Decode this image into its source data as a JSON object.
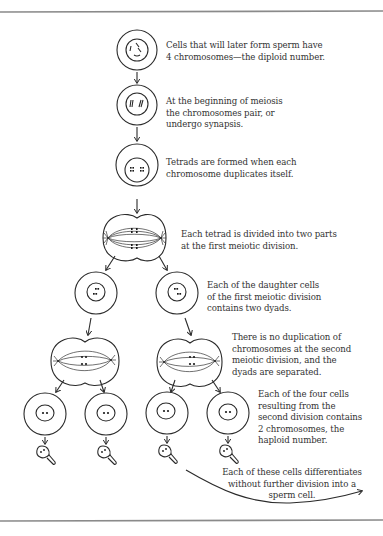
{
  "figure": {
    "colors": {
      "line": "#2a2a2a",
      "text": "#333333",
      "rule": "#8a8a8a",
      "background": "#ffffff"
    },
    "captions": {
      "step1": "Cells that will later form sperm have\n4 chromosomes—the diploid number.",
      "step2": "At the beginning of meiosis\nthe chromosomes pair, or\nundergo synapsis.",
      "step3": "Tetrads are formed when each\nchromosome duplicates itself.",
      "step4": "Each tetrad is divided into two parts\nat the first meiotic division.",
      "step5": "Each of the daughter cells\nof the first meiotic division\ncontains two dyads.",
      "step6": "There is no duplication of\nchromosomes at the second\nmeiotic division, and the\ndyads are separated.",
      "step7": "Each of the four cells\nresulting from the\nsecond division contains\n2 chromosomes, the\nhaploid number.",
      "step8": "Each of these cells differentiates\nwithout further division into a\nsperm cell."
    },
    "stages": [
      {
        "id": "diploid-cell",
        "label": "Diploid cell (4 chromosomes)"
      },
      {
        "id": "synapsis-cell",
        "label": "Synapsis"
      },
      {
        "id": "tetrad-cell",
        "label": "Tetrads"
      },
      {
        "id": "first-division",
        "label": "First meiotic division"
      },
      {
        "id": "daughter-cells",
        "label": "Daughter cells (two dyads)"
      },
      {
        "id": "second-division",
        "label": "Second meiotic division"
      },
      {
        "id": "haploid-cells",
        "label": "Four haploid cells"
      },
      {
        "id": "sperm-cells",
        "label": "Sperm cells"
      }
    ]
  }
}
